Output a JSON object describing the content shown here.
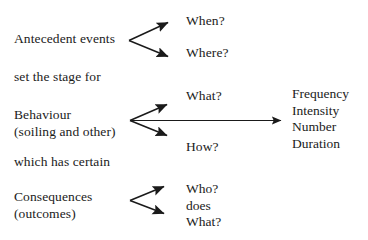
{
  "diagram": {
    "background_color": "#ffffff",
    "text_color": "#1b1b1b",
    "arrow_color": "#1a1a1a"
  },
  "left_column": {
    "antecedent": "Antecedent events",
    "connector_1": "set the stage for",
    "behaviour": "Behaviour",
    "behaviour_detail": "(soiling and other)",
    "connector_2": "which has certain",
    "consequences": "Consequences",
    "consequences_detail": "(outcomes)"
  },
  "middle_column": {
    "antecedent_questions": [
      "When?",
      "Where?"
    ],
    "behaviour_question_top": "What?",
    "behaviour_question_bottom": "How?",
    "consequence_questions": [
      "Who?",
      "does",
      "What?"
    ]
  },
  "right_column": {
    "measures": [
      "Frequency",
      "Intensity",
      "Number",
      "Duration"
    ]
  },
  "arrows": {
    "antecedent_branch_up": "arrow-antecedent-to-when",
    "antecedent_branch_down": "arrow-antecedent-to-where",
    "behaviour_branch_up": "arrow-behaviour-to-what",
    "behaviour_branch_down": "arrow-behaviour-to-how",
    "behaviour_to_measures": "arrow-behaviour-to-measures",
    "consequence_branch_up": "arrow-consequences-to-who",
    "consequence_branch_down": "arrow-consequences-to-what"
  }
}
